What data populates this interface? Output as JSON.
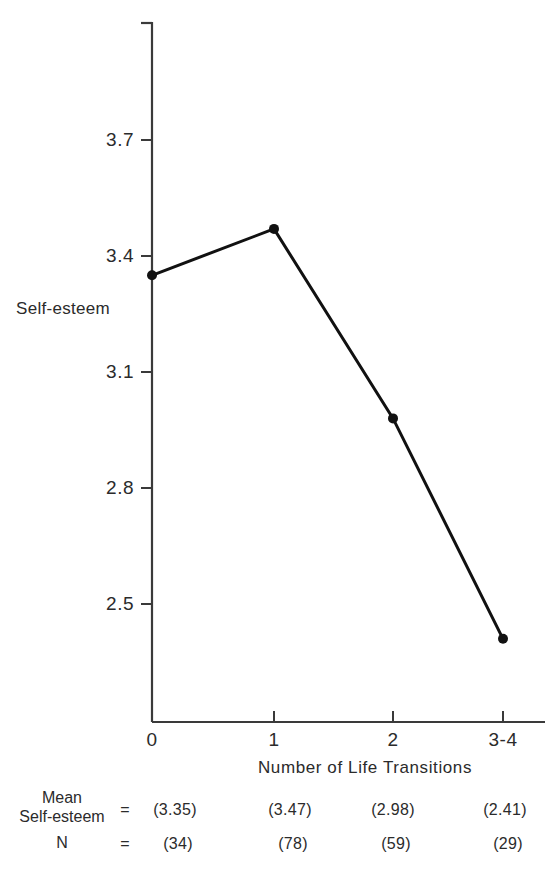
{
  "chart_data": {
    "type": "line",
    "title": "",
    "xlabel": "Number of Life Transitions",
    "ylabel": "Self-esteem",
    "categories": [
      "0",
      "1",
      "2",
      "3-4"
    ],
    "values": [
      3.35,
      3.47,
      2.98,
      2.41
    ],
    "series": [
      {
        "name": "Mean Self-esteem",
        "values": [
          3.35,
          3.47,
          2.98,
          2.41
        ]
      }
    ],
    "n_values": [
      34,
      78,
      59,
      29
    ],
    "yticks": [
      "3.7",
      "3.4",
      "3.1",
      "2.8",
      "2.5"
    ],
    "ytick_values": [
      3.7,
      3.4,
      3.1,
      2.8,
      2.5
    ],
    "xticks": [
      "0",
      "1",
      "2",
      "3-4"
    ],
    "ylim": [
      2.3,
      3.88
    ],
    "grid": false,
    "legend": "none",
    "marker": "filled-circle",
    "line_color": "#111111",
    "marker_color": "#111111",
    "axis_color": "#3a3a3a"
  },
  "axes": {
    "y_label": "Self-esteem",
    "x_label": "Number of Life Transitions",
    "y_ticks": [
      {
        "label": "3.7",
        "value": 3.7
      },
      {
        "label": "3.4",
        "value": 3.4
      },
      {
        "label": "3.1",
        "value": 3.1
      },
      {
        "label": "2.8",
        "value": 2.8
      },
      {
        "label": "2.5",
        "value": 2.5
      }
    ],
    "x_ticks": [
      {
        "label": "0",
        "value": 0
      },
      {
        "label": "1",
        "value": 1
      },
      {
        "label": "2",
        "value": 2
      },
      {
        "label": "3-4",
        "value": 3
      }
    ]
  },
  "stats_table": {
    "row_mean_label_line1": "Mean",
    "row_mean_label_line2": "Self-esteem",
    "row_n_label": "N",
    "equals_mean": "=",
    "equals_n": "=",
    "mean_values": [
      "(3.35)",
      "(3.47)",
      "(2.98)",
      "(2.41)"
    ],
    "n_values": [
      "(34)",
      "(78)",
      "(59)",
      "(29)"
    ]
  }
}
